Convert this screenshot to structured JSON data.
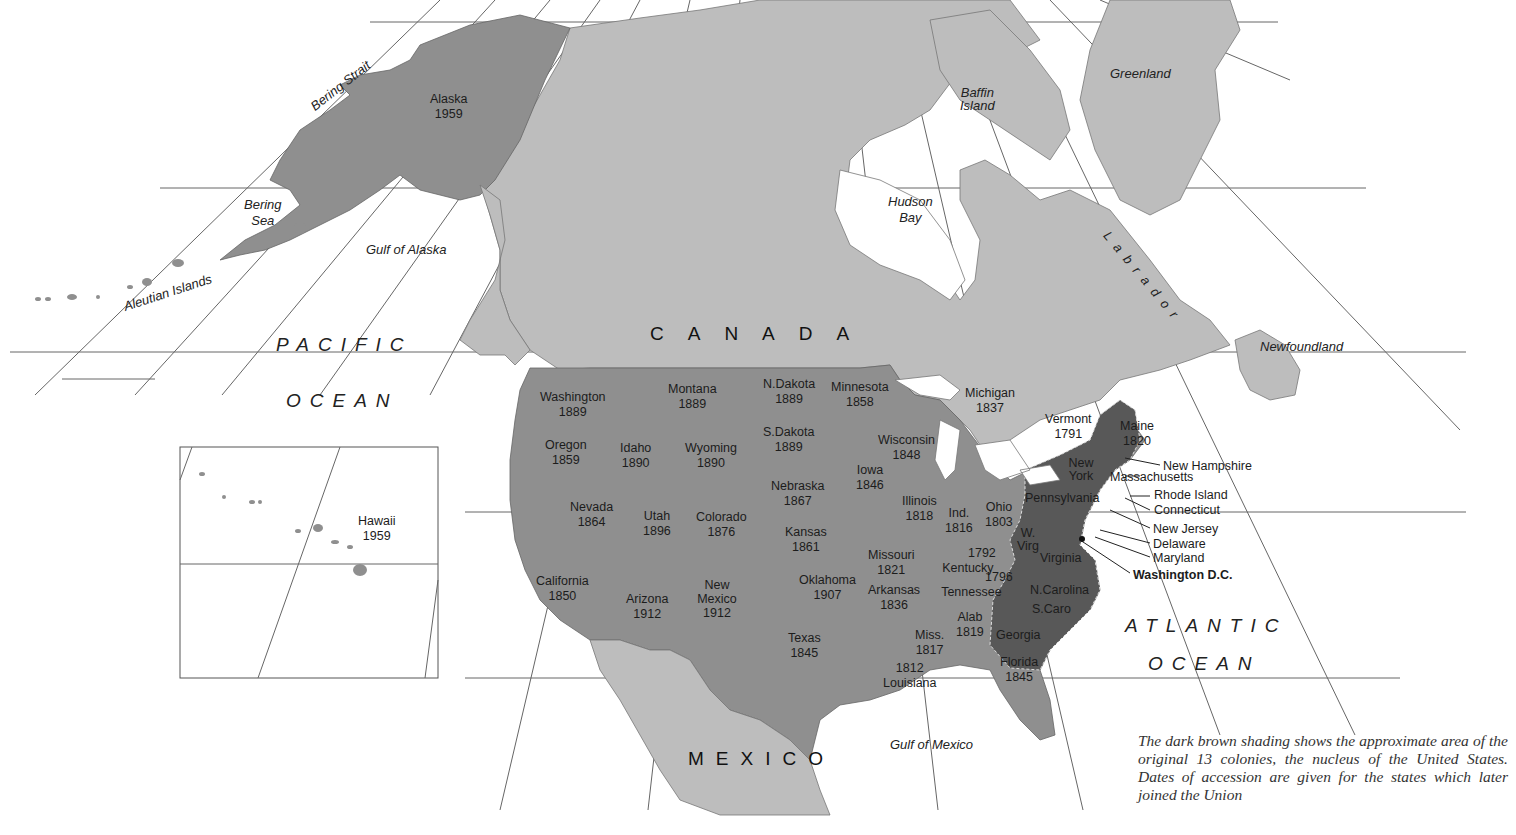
{
  "map": {
    "colors": {
      "background": "#ffffff",
      "foreign_land": "#bdbdbd",
      "us_states": "#8f8f8f",
      "original_colonies": "#585858",
      "grid_line": "#555555"
    },
    "countries": [
      "CANADA",
      "MEXICO"
    ],
    "oceans": {
      "pacific": [
        "PACIFIC",
        "OCEAN"
      ],
      "atlantic": [
        "ATLANTIC",
        "OCEAN"
      ]
    },
    "water_labels": {
      "bering_strait": "Bering Strait",
      "bering_sea": [
        "Bering",
        "Sea"
      ],
      "gulf_of_alaska": "Gulf of Alaska",
      "aleutian_islands": "Aleutian Islands",
      "hudson_bay": [
        "Hudson",
        "Bay"
      ],
      "baffin_island": [
        "Baffin",
        "Island"
      ],
      "greenland": "Greenland",
      "labrador": "Labrador",
      "newfoundland": "Newfoundland",
      "gulf_of_mexico": "Gulf of Mexico"
    },
    "states": [
      {
        "name": "Alaska",
        "year": "1959"
      },
      {
        "name": "Hawaii",
        "year": "1959"
      },
      {
        "name": "Washington",
        "year": "1889"
      },
      {
        "name": "Oregon",
        "year": "1859"
      },
      {
        "name": "California",
        "year": "1850"
      },
      {
        "name": "Idaho",
        "year": "1890"
      },
      {
        "name": "Nevada",
        "year": "1864"
      },
      {
        "name": "Montana",
        "year": "1889"
      },
      {
        "name": "Wyoming",
        "year": "1890"
      },
      {
        "name": "Utah",
        "year": "1896"
      },
      {
        "name": "Arizona",
        "year": "1912"
      },
      {
        "name": "Colorado",
        "year": "1876"
      },
      {
        "name": "New Mexico",
        "year": "1912"
      },
      {
        "name": "N.Dakota",
        "year": "1889"
      },
      {
        "name": "S.Dakota",
        "year": "1889"
      },
      {
        "name": "Nebraska",
        "year": "1867"
      },
      {
        "name": "Kansas",
        "year": "1861"
      },
      {
        "name": "Oklahoma",
        "year": "1907"
      },
      {
        "name": "Texas",
        "year": "1845"
      },
      {
        "name": "Minnesota",
        "year": "1858"
      },
      {
        "name": "Iowa",
        "year": "1846"
      },
      {
        "name": "Missouri",
        "year": "1821"
      },
      {
        "name": "Arkansas",
        "year": "1836"
      },
      {
        "name": "Louisiana",
        "year": "1812"
      },
      {
        "name": "Wisconsin",
        "year": "1848"
      },
      {
        "name": "Illinois",
        "year": "1818"
      },
      {
        "name": "Michigan",
        "year": "1837"
      },
      {
        "name": "Ind.",
        "year": "1816"
      },
      {
        "name": "Ohio",
        "year": "1803"
      },
      {
        "name": "Kentucky",
        "year": "1792"
      },
      {
        "name": "Tennessee",
        "year": "1796"
      },
      {
        "name": "Miss.",
        "year": "1817"
      },
      {
        "name": "Alab",
        "year": "1819"
      },
      {
        "name": "Florida",
        "year": "1845"
      },
      {
        "name": "Vermont",
        "year": "1791"
      },
      {
        "name": "Maine",
        "year": "1820"
      }
    ],
    "colonies": [
      "New York",
      "Pennsylvania",
      "W. Virg",
      "Virginia",
      "N.Carolina",
      "S.Caro",
      "Georgia"
    ],
    "callouts": [
      "New Hampshire",
      "Massachusetts",
      "Rhode Island",
      "Connecticut",
      "New Jersey",
      "Delaware",
      "Maryland",
      "Washington D.C."
    ],
    "caption": "The dark brown shading shows the approximate area of the original 13 colonies, the nucleus of the United States. Dates of accession are given for the states which later joined the Union"
  }
}
